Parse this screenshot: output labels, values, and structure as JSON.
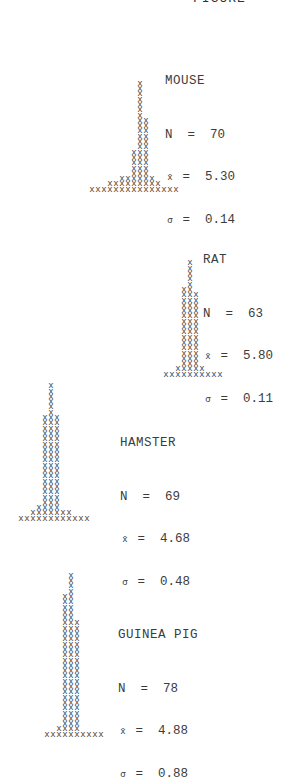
{
  "header": {
    "text": "FIGURE"
  },
  "chart_data": [
    {
      "type": "histogram-tally",
      "title": "MOUSE",
      "N": 70,
      "mean": 5.3,
      "sd": 0.14,
      "counts": [
        1,
        1,
        1,
        2,
        2,
        3,
        3,
        8,
        21,
        14,
        3,
        2,
        1,
        1,
        1
      ]
    },
    {
      "type": "histogram-tally",
      "title": "RAT",
      "N": 63,
      "mean": 5.8,
      "sd": 0.11,
      "counts": [
        1,
        1,
        2,
        17,
        22,
        16,
        2,
        1,
        1,
        1
      ]
    },
    {
      "type": "histogram-tally",
      "title": "HAMSTER",
      "N": 69,
      "mean": 4.68,
      "sd": 0.48,
      "counts": [
        1,
        1,
        2,
        3,
        20,
        26,
        20,
        2,
        2,
        1,
        1,
        1
      ]
    },
    {
      "type": "histogram-tally",
      "title": "GUINEA PIG",
      "N": 78,
      "mean": 4.88,
      "sd": 0.88,
      "counts": [
        1,
        1,
        2,
        27,
        31,
        22,
        1,
        1,
        1,
        1
      ]
    }
  ],
  "panels": [
    {
      "name": "MOUSE",
      "n": "N  =  70",
      "mean": "=  5.30",
      "sd": "=  0.14"
    },
    {
      "name": "RAT",
      "n": "N  =  63",
      "mean": "=  5.80",
      "sd": "=  0.11"
    },
    {
      "name": "HAMSTER",
      "n": "N  =  69",
      "mean": "=  4.68",
      "sd": "=  0.48"
    },
    {
      "name": "GUINEA PIG",
      "n": "N  =  78",
      "mean": "=  4.88",
      "sd": "=  0.88"
    }
  ],
  "symbols": {
    "xbar": "x̄",
    "sigma": "σ"
  }
}
